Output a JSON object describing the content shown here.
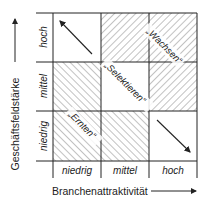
{
  "diagram": {
    "type": "portfolio-matrix",
    "x_axis": {
      "label": "Branchenattraktivität",
      "ticks": [
        "niedrig",
        "mittel",
        "hoch"
      ]
    },
    "y_axis": {
      "label": "Geschäftsfeldstärke",
      "ticks": [
        "hoch",
        "mittel",
        "niedrig"
      ]
    },
    "strategies": {
      "grow": "„Wachsen“",
      "select": "„Selektieren“",
      "harvest": "„Ernten“"
    },
    "cells": [
      {
        "row": "hoch",
        "col": "niedrig",
        "fill": "white",
        "content": "arrow-up-left"
      },
      {
        "row": "hoch",
        "col": "mittel",
        "fill": "hatch-back"
      },
      {
        "row": "hoch",
        "col": "hoch",
        "fill": "hatch-back"
      },
      {
        "row": "mittel",
        "col": "niedrig",
        "fill": "hatch-forward"
      },
      {
        "row": "mittel",
        "col": "mittel",
        "fill": "white"
      },
      {
        "row": "mittel",
        "col": "hoch",
        "fill": "hatch-back"
      },
      {
        "row": "niedrig",
        "col": "niedrig",
        "fill": "hatch-forward"
      },
      {
        "row": "niedrig",
        "col": "mittel",
        "fill": "hatch-forward"
      },
      {
        "row": "niedrig",
        "col": "hoch",
        "fill": "white",
        "content": "arrow-down-right"
      }
    ],
    "colors": {
      "line": "#222222",
      "hatch": "#555555",
      "background": "#ffffff"
    }
  }
}
